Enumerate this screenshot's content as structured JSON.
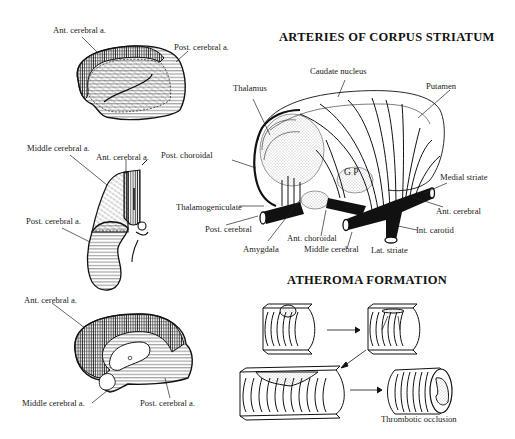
{
  "figure": {
    "panels": [
      {
        "id": "lateral-hemisphere",
        "labels": [
          "Ant. cerebral a.",
          "Post. cerebral a."
        ]
      },
      {
        "id": "coronal-hemisphere",
        "labels": [
          "Middle cerebral a.",
          "Ant. cerebral a.",
          "Post. cerebral a."
        ]
      },
      {
        "id": "medial-hemisphere",
        "labels": [
          "Ant. cerebral a.",
          "Middle cerebral a.",
          "Post. cerebral a."
        ]
      },
      {
        "id": "corpus-striatum",
        "title": "ARTERIES OF CORPUS STRIATUM",
        "labels": [
          "Caudate nucleus",
          "Thalamus",
          "Putamen",
          "Post. choroidal",
          "G P",
          "Medial striate",
          "Thalamogeniculate",
          "Ant. cerebral",
          "Post. cerebral",
          "Int. carotid",
          "Ant. choroidal",
          "Amygdala",
          "Middle cerebral",
          "Lat. striate"
        ]
      },
      {
        "id": "atheroma",
        "title": "ATHEROMA FORMATION",
        "labels": [
          "Thrombotic occlusion"
        ]
      }
    ]
  },
  "colors": {
    "ink": "#1a1a1a",
    "background": "#ffffff"
  }
}
